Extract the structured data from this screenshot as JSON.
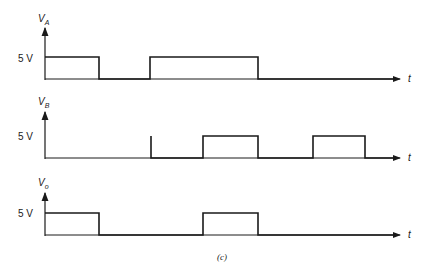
{
  "figure": {
    "caption": "(c)",
    "time_axis_label": "t",
    "panels": [
      {
        "id": "VA",
        "y_symbol": "V",
        "y_subscript": "A",
        "level_label": "5 V",
        "transitions_x": [
          45,
          99,
          150,
          258,
          400
        ],
        "states": [
          "high",
          "low",
          "high",
          "low"
        ]
      },
      {
        "id": "VB",
        "y_symbol": "V",
        "y_subscript": "B",
        "level_label": "5 V",
        "transitions_x": [
          45,
          151,
          203,
          258,
          313,
          365,
          400
        ],
        "states": [
          "low",
          "low",
          "high",
          "low",
          "high",
          "low"
        ]
      },
      {
        "id": "Vo",
        "y_symbol": "V",
        "y_subscript": "o",
        "level_label": "5 V",
        "transitions_x": [
          45,
          99,
          203,
          258,
          400
        ],
        "states": [
          "high",
          "low",
          "high",
          "low"
        ]
      }
    ]
  }
}
